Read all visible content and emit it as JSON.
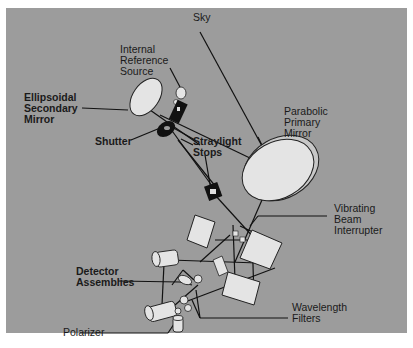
{
  "figure": {
    "background_color": "#9c9c9c",
    "component_fill": "#e2e2e2",
    "dark_component_fill": "#111111",
    "line_color": "#111111"
  },
  "labels": {
    "sky": "Sky",
    "internal_reference_source": "Internal\nReference\nSource",
    "ellipsoidal_secondary_mirror": "Ellipsoidal\nSecondary\nMirror",
    "shutter": "Shutter",
    "straylight_stops": "Straylight\nStops",
    "parabolic_primary_mirror": "Parabolic\nPrimary\nMirror",
    "vibrating_beam_interrupter": "Vibrating\nBeam\nInterrupter",
    "detector_assemblies": "Detector\nAssemblies",
    "wavelength_filters": "Wavelength\nFilters",
    "polarizer": "Polarizer"
  }
}
